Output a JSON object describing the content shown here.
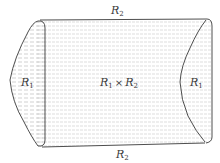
{
  "figure": {
    "labels": {
      "top": {
        "base": "R",
        "sub": "2"
      },
      "bottom": {
        "base": "R",
        "sub": "2"
      },
      "left": {
        "base": "R",
        "sub": "1"
      },
      "right": {
        "base": "R",
        "sub": "1"
      },
      "center": {
        "left_base": "R",
        "left_sub": "1",
        "operator": "×",
        "right_base": "R",
        "right_sub": "2"
      }
    },
    "colors": {
      "outline": "#3a3a3a",
      "hatch": "#b8b8b8",
      "background": "#ffffff"
    }
  }
}
